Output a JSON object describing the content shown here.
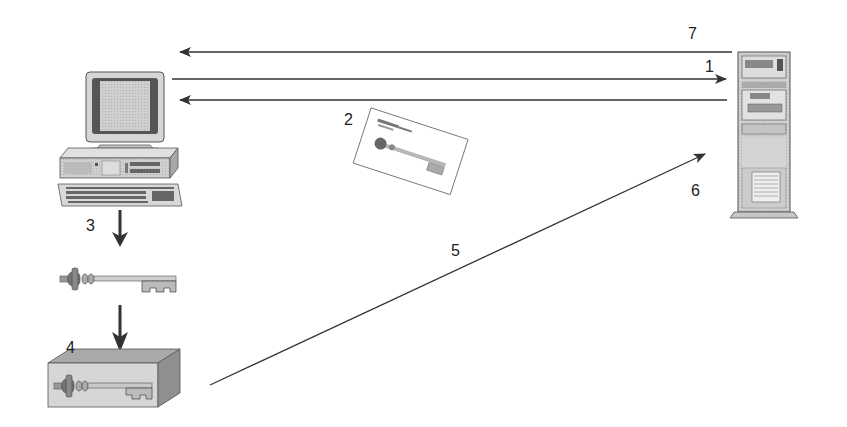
{
  "diagram": {
    "type": "public-key exchange / session key flow",
    "nodes": [
      {
        "id": "client",
        "name": "Client computer",
        "icon": "desktop-computer-icon"
      },
      {
        "id": "server",
        "name": "Server",
        "icon": "tower-server-icon"
      },
      {
        "id": "certificate",
        "name": "Certificate with public key",
        "icon": "certificate-key-icon"
      },
      {
        "id": "session-key",
        "name": "Session key",
        "icon": "key-icon"
      },
      {
        "id": "encrypted-key",
        "name": "Encrypted session key",
        "icon": "locked-box-key-icon"
      }
    ],
    "labels": {
      "step1": "1",
      "step2": "2",
      "step3": "3",
      "step4": "4",
      "step5": "5",
      "step6": "6",
      "step7": "7"
    },
    "edges": [
      {
        "from": "server",
        "to": "client",
        "label": "7"
      },
      {
        "from": "client",
        "to": "server",
        "label": "1"
      },
      {
        "from": "server",
        "to": "client",
        "label": "2"
      },
      {
        "from": "client",
        "to": "session-key",
        "label": "3"
      },
      {
        "from": "session-key",
        "to": "encrypted-key",
        "label": "4"
      },
      {
        "from": "encrypted-key",
        "to": "server",
        "label": "5"
      }
    ]
  },
  "colors": {
    "line": "#333333",
    "device_light": "#d9d9d9",
    "device_mid": "#b5b5b5",
    "device_dark": "#6b6b6b",
    "key_body": "#c8c8c8"
  }
}
